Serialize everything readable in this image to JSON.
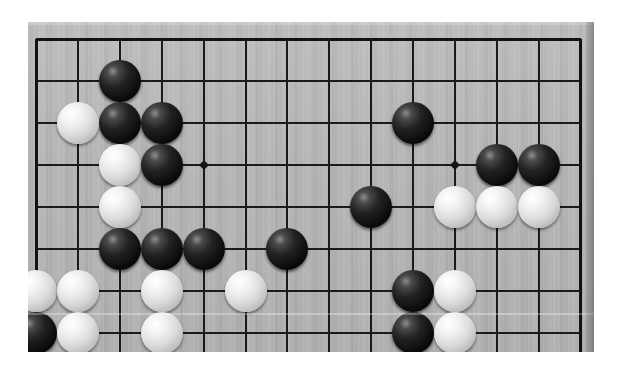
{
  "app": {
    "title": "Go Board Position",
    "kind": "goban-photo",
    "background_color": "#ffffff"
  },
  "board": {
    "name": "go-board",
    "wood_color": "#b4b4b4",
    "line_color": "#1a1a1a",
    "surface": {
      "x": 28,
      "y": 22,
      "width": 566,
      "height": 330
    },
    "right_edge": {
      "x": 586,
      "width": 8
    },
    "grid": {
      "columns": 14,
      "rows": 8,
      "x_start": 36,
      "y_start": 39,
      "spacing_x": 41.9,
      "spacing_y": 42.0,
      "note_visible_crop": "board is cropped top and bottom; only part of a full 19x19 goban is shown"
    },
    "star_points": [
      {
        "col": 4,
        "row": 3,
        "x": 215,
        "y": 165
      },
      {
        "col": 10,
        "row": 3,
        "x": 459,
        "y": 165
      }
    ],
    "stone_radius": 21,
    "scan_streak_y": 313
  },
  "stones": [
    {
      "color": "black",
      "col": 2,
      "row": 1
    },
    {
      "color": "black",
      "col": 2,
      "row": 2
    },
    {
      "color": "white",
      "col": 1,
      "row": 2
    },
    {
      "color": "black",
      "col": 3,
      "row": 2
    },
    {
      "color": "white",
      "col": 2,
      "row": 3
    },
    {
      "color": "black",
      "col": 3,
      "row": 3
    },
    {
      "color": "white",
      "col": 2,
      "row": 4
    },
    {
      "color": "black",
      "col": 9,
      "row": 2
    },
    {
      "color": "black",
      "col": 11,
      "row": 3
    },
    {
      "color": "black",
      "col": 12,
      "row": 3
    },
    {
      "color": "white",
      "col": 10,
      "row": 4
    },
    {
      "color": "white",
      "col": 11,
      "row": 4
    },
    {
      "color": "white",
      "col": 12,
      "row": 4
    },
    {
      "color": "black",
      "col": 8,
      "row": 4
    },
    {
      "color": "black",
      "col": 2,
      "row": 5
    },
    {
      "color": "black",
      "col": 3,
      "row": 5
    },
    {
      "color": "black",
      "col": 4,
      "row": 5
    },
    {
      "color": "black",
      "col": 6,
      "row": 5
    },
    {
      "color": "white",
      "col": 0,
      "row": 6
    },
    {
      "color": "white",
      "col": 1,
      "row": 6
    },
    {
      "color": "white",
      "col": 3,
      "row": 6
    },
    {
      "color": "white",
      "col": 5,
      "row": 6
    },
    {
      "color": "black",
      "col": 9,
      "row": 6
    },
    {
      "color": "white",
      "col": 10,
      "row": 6
    },
    {
      "color": "black",
      "col": 0,
      "row": 7
    },
    {
      "color": "white",
      "col": 1,
      "row": 7
    },
    {
      "color": "white",
      "col": 3,
      "row": 7
    },
    {
      "color": "black",
      "col": 9,
      "row": 7
    },
    {
      "color": "white",
      "col": 10,
      "row": 7
    }
  ],
  "counts": {
    "black_stones": 14,
    "white_stones": 15,
    "total_stones": 29
  }
}
